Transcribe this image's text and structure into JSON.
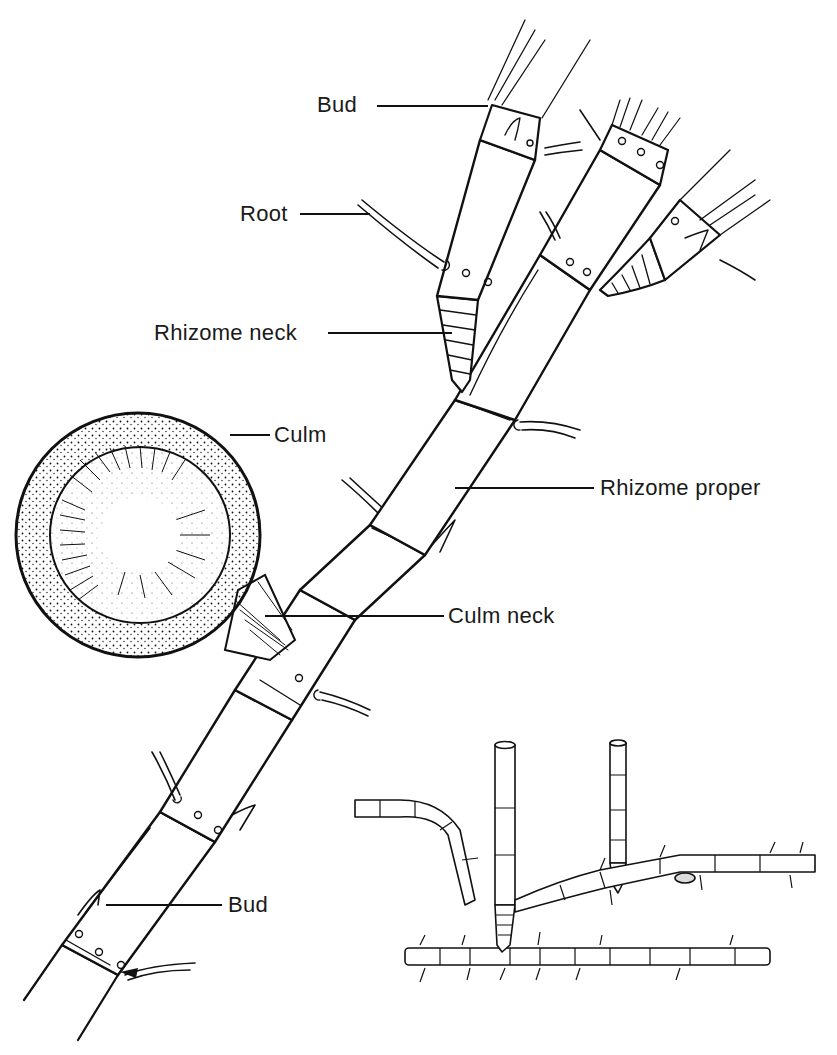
{
  "figure": {
    "ink_color": "#111111",
    "background": "#ffffff"
  },
  "labels": {
    "bud_top": "Bud",
    "root": "Root",
    "rhizome_neck": "Rhizome neck",
    "culm": "Culm",
    "rhizome_proper": "Rhizome proper",
    "culm_neck": "Culm neck",
    "bud_bottom": "Bud"
  },
  "inset": {
    "description": "Small illustration of branching rhizome system with two vertical culms"
  }
}
